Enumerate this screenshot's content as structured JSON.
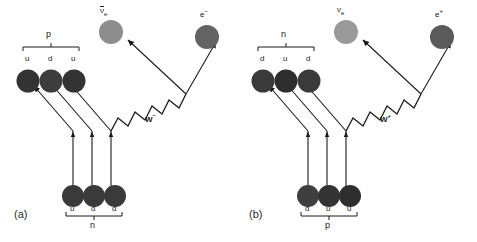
{
  "figure": {
    "type": "feynman-beta-decay",
    "background": "#ffffff",
    "quark_color": "#3a3a3a",
    "quark_color_dark": "#2e2e2e",
    "neutrino_color": "#8a8a8a",
    "electron_color": "#5e5e5e",
    "line_color": "#1a1a1a"
  },
  "panel_a": {
    "caption": "(a)",
    "w_boson": "W",
    "w_charge": "−",
    "top_nucleon": "p",
    "bottom_nucleon": "n",
    "top_quarks": [
      "u",
      "d",
      "u"
    ],
    "bottom_quarks": [
      "u",
      "d",
      "d"
    ],
    "lepton_left_symbol": "ν",
    "lepton_left_sub": "e",
    "lepton_left_bar": true,
    "lepton_left_name": "anti-electron-neutrino",
    "lepton_right_symbol": "e",
    "lepton_right_sup": "−",
    "lepton_right_name": "electron"
  },
  "panel_b": {
    "caption": "(b)",
    "w_boson": "W",
    "w_charge": "+",
    "top_nucleon": "n",
    "bottom_nucleon": "p",
    "top_quarks": [
      "d",
      "u",
      "d"
    ],
    "bottom_quarks": [
      "d",
      "u",
      "u"
    ],
    "lepton_left_symbol": "ν",
    "lepton_left_sub": "e",
    "lepton_left_bar": false,
    "lepton_left_name": "electron-neutrino",
    "lepton_right_symbol": "e",
    "lepton_right_sup": "+",
    "lepton_right_name": "positron"
  }
}
